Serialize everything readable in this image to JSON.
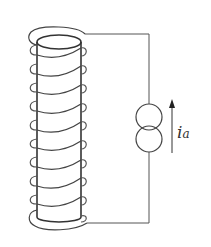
{
  "diagram": {
    "type": "solenoid-circuit",
    "components": {
      "solenoid": {
        "label": "",
        "turns": 10
      },
      "source": {
        "type": "current-source",
        "symbol": "double-circle"
      },
      "current_arrow": {
        "direction": "up"
      }
    },
    "labels": {
      "current_symbol": "i",
      "current_subscript": "a"
    },
    "colors": {
      "stroke": "#333333",
      "wire": "#555555",
      "background": "#ffffff"
    }
  }
}
